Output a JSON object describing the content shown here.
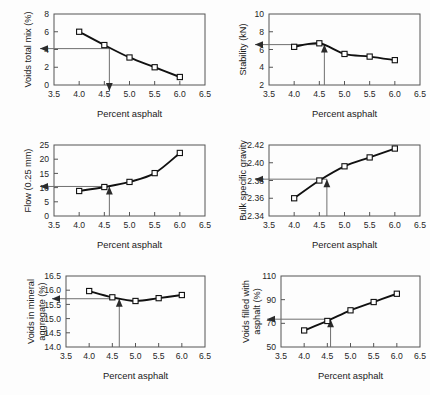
{
  "figure": {
    "background": "#fdfdfd",
    "line_color": "#111111",
    "marker_fill": "#ffffff",
    "guide_color": "#6f6f6f",
    "axis_color": "#555555"
  },
  "shared": {
    "xlabel": "Percent asphalt",
    "x_ticks": [
      "3.5",
      "4.0",
      "4.5",
      "5.0",
      "5.5",
      "6.0",
      "6.5"
    ],
    "x_values": [
      3.5,
      4.0,
      4.5,
      5.0,
      5.5,
      6.0,
      6.5
    ],
    "design_asphalt": 4.6
  },
  "chart_data": [
    {
      "id": "voids-total-mix",
      "type": "line",
      "title": "",
      "xlabel": "Percent asphalt",
      "ylabel": "Voids total mix (%)",
      "ylabel_lines": [
        "Voids total mix (%)"
      ],
      "xlim": [
        3.5,
        6.5
      ],
      "ylim": [
        0,
        8
      ],
      "x_ticks": [
        3.5,
        4.0,
        4.5,
        5.0,
        5.5,
        6.0,
        6.5
      ],
      "x_ticklabels": [
        "3.5",
        "4.0",
        "4.5",
        "5.0",
        "5.5",
        "6.0",
        "6.5"
      ],
      "y_ticks": [
        0,
        2,
        4,
        6,
        8
      ],
      "y_ticklabels": [
        "0",
        "2",
        "4",
        "6",
        "8"
      ],
      "x": [
        4.0,
        4.5,
        5.0,
        5.5,
        6.0
      ],
      "values": [
        6.0,
        4.5,
        3.1,
        2.0,
        0.9
      ],
      "grid": false,
      "legend": false,
      "annotation": {
        "design_x": 4.6,
        "design_y": 4.1,
        "h_arrow": true,
        "v_arrow": true,
        "v_arrow_direction": "down"
      }
    },
    {
      "id": "stability",
      "type": "line",
      "title": "",
      "xlabel": "Percent asphalt",
      "ylabel": "Stability (kN)",
      "ylabel_lines": [
        "Stability (kN)"
      ],
      "xlim": [
        3.5,
        6.5
      ],
      "ylim": [
        2,
        10
      ],
      "x_ticks": [
        3.5,
        4.0,
        4.5,
        5.0,
        5.5,
        6.0,
        6.5
      ],
      "x_ticklabels": [
        "3.5",
        "4.0",
        "4.5",
        "5.0",
        "5.5",
        "6.0",
        "6.5"
      ],
      "y_ticks": [
        2,
        4,
        6,
        8,
        10
      ],
      "y_ticklabels": [
        "2",
        "4",
        "6",
        "8",
        "10"
      ],
      "x": [
        4.0,
        4.5,
        5.0,
        5.5,
        6.0
      ],
      "values": [
        6.3,
        6.7,
        5.5,
        5.2,
        4.8
      ],
      "grid": false,
      "legend": false,
      "annotation": {
        "design_x": 4.6,
        "design_y": 6.55,
        "h_arrow": true,
        "v_arrow": true,
        "v_arrow_direction": "up"
      }
    },
    {
      "id": "flow",
      "type": "line",
      "title": "",
      "xlabel": "Percent asphalt",
      "ylabel": "Flow (0.25 mm)",
      "ylabel_lines": [
        "Flow (0.25 mm)"
      ],
      "xlim": [
        3.5,
        6.5
      ],
      "ylim": [
        0,
        25
      ],
      "x_ticks": [
        3.5,
        4.0,
        4.5,
        5.0,
        5.5,
        6.0,
        6.5
      ],
      "x_ticklabels": [
        "3.5",
        "4.0",
        "4.5",
        "5.0",
        "5.5",
        "6.0",
        "6.5"
      ],
      "y_ticks": [
        0,
        5,
        10,
        15,
        20,
        25
      ],
      "y_ticklabels": [
        "0",
        "5",
        "10",
        "15",
        "20",
        "25"
      ],
      "x": [
        4.0,
        4.5,
        5.0,
        5.5,
        6.0
      ],
      "values": [
        8.8,
        10.2,
        12.0,
        15.1,
        22.2
      ],
      "grid": false,
      "legend": false,
      "annotation": {
        "design_x": 4.6,
        "design_y": 10.4,
        "h_arrow": true,
        "v_arrow": true,
        "v_arrow_direction": "up"
      }
    },
    {
      "id": "bulk-specific-gravity",
      "type": "line",
      "title": "",
      "xlabel": "Percent asphalt",
      "ylabel": "Bulk specific gravity",
      "ylabel_lines": [
        "Bulk specific gravity"
      ],
      "xlim": [
        3.5,
        6.5
      ],
      "ylim": [
        2.34,
        2.42
      ],
      "x_ticks": [
        3.5,
        4.0,
        4.5,
        5.0,
        5.5,
        6.0,
        6.5
      ],
      "x_ticklabels": [
        "3.5",
        "4.0",
        "4.5",
        "5.0",
        "5.5",
        "6.0",
        "6.5"
      ],
      "y_ticks": [
        2.34,
        2.36,
        2.38,
        2.4,
        2.42
      ],
      "y_ticklabels": [
        "2.34",
        "2.36",
        "2.38",
        "2.40",
        "2.42"
      ],
      "x": [
        4.0,
        4.5,
        5.0,
        5.5,
        6.0
      ],
      "values": [
        2.36,
        2.38,
        2.396,
        2.406,
        2.416
      ],
      "grid": false,
      "legend": false,
      "annotation": {
        "design_x": 4.65,
        "design_y": 2.3815,
        "h_arrow": true,
        "v_arrow": true,
        "v_arrow_direction": "up"
      }
    },
    {
      "id": "voids-in-mineral-aggregate",
      "type": "line",
      "title": "",
      "xlabel": "Percent asphalt",
      "ylabel": "Voids in mineral aggregate (%)",
      "ylabel_lines": [
        "Voids in mineral",
        "aggregate (%)"
      ],
      "xlim": [
        3.5,
        6.5
      ],
      "ylim": [
        14.0,
        16.5
      ],
      "x_ticks": [
        3.5,
        4.0,
        4.5,
        5.0,
        5.5,
        6.0,
        6.5
      ],
      "x_ticklabels": [
        "3.5",
        "4.0",
        "4.5",
        "5.0",
        "5.5",
        "6.0",
        "6.5"
      ],
      "y_ticks": [
        14.0,
        14.5,
        15.0,
        15.5,
        16.0,
        16.5
      ],
      "y_ticklabels": [
        "14.0",
        "14.5",
        "15.0",
        "15.5",
        "16.0",
        "16.5"
      ],
      "x": [
        4.0,
        4.5,
        5.0,
        5.5,
        6.0
      ],
      "values": [
        15.97,
        15.75,
        15.62,
        15.72,
        15.83
      ],
      "grid": false,
      "legend": false,
      "annotation": {
        "design_x": 4.65,
        "design_y": 15.7,
        "h_arrow": true,
        "v_arrow": true,
        "v_arrow_direction": "up"
      }
    },
    {
      "id": "voids-filled-with-asphalt",
      "type": "line",
      "title": "",
      "xlabel": "Percent asphalt",
      "ylabel": "Voids filled with asphalt (%)",
      "ylabel_lines": [
        "Voids filled with",
        "asphalt (%)"
      ],
      "xlim": [
        3.5,
        6.5
      ],
      "ylim": [
        50,
        110
      ],
      "x_ticks": [
        3.5,
        4.0,
        4.5,
        5.0,
        5.5,
        6.0,
        6.5
      ],
      "x_ticklabels": [
        "3.5",
        "4.0",
        "4.5",
        "5.0",
        "5.5",
        "6.0",
        "6.5"
      ],
      "y_ticks": [
        50,
        70,
        90,
        110
      ],
      "y_ticklabels": [
        "50",
        "70",
        "90",
        "110"
      ],
      "x": [
        4.0,
        4.5,
        5.0,
        5.5,
        6.0
      ],
      "values": [
        64,
        72,
        81,
        88,
        95
      ],
      "grid": false,
      "legend": false,
      "annotation": {
        "design_x": 4.57,
        "design_y": 73.5,
        "h_arrow": true,
        "v_arrow": true,
        "v_arrow_direction": "up"
      }
    }
  ]
}
